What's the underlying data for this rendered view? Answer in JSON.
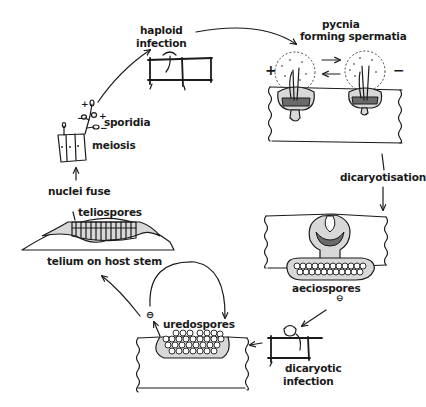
{
  "diagram": {
    "type": "life-cycle",
    "colors": {
      "ink": "#1a1a1a",
      "background": "#ffffff",
      "stipple": "#d8d8d8"
    },
    "stages": {
      "haploid_infection": {
        "line1": "haploid",
        "line2": "infection"
      },
      "pycnia": {
        "line1": "pycnia",
        "line2": "forming  spermatia",
        "plus": "+",
        "minus": "−"
      },
      "dicaryotisation": {
        "label": "dicaryotisation"
      },
      "aeciospores": {
        "label": "aeciospores",
        "sign": "⊖"
      },
      "dicaryotic_infection": {
        "line1": "dicaryotic",
        "line2": "infection"
      },
      "uredospores": {
        "label": "uredospores",
        "sign": "⊖"
      },
      "teliospores": {
        "label": "teliospores",
        "caption": "telium on host stem"
      },
      "nuclei_fuse": {
        "label": "nuclei fuse"
      },
      "meiosis": {
        "label": "meiosis"
      },
      "sporidia": {
        "label": "sporidia",
        "signs": [
          "+",
          "−",
          "+",
          "−"
        ]
      }
    },
    "flow": [
      "sporidia → haploid infection",
      "haploid infection → pycnia forming spermatia",
      "pycnia (+ ⇄ −) → dicaryotisation",
      "dicaryotisation → aeciospores",
      "aeciospores → dicaryotic infection",
      "dicaryotic infection → uredospores",
      "uredospores → uredospores (repeat cycle)",
      "uredospores → telium on host stem",
      "teliospores → nuclei fuse → meiosis → sporidia"
    ]
  }
}
